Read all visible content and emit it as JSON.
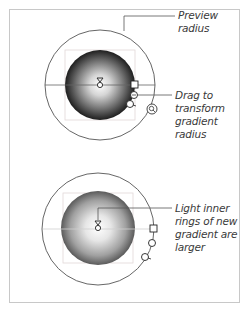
{
  "figure": {
    "panels": [
      {
        "id": "before",
        "callouts": [
          {
            "lines": [
              "Preview",
              "radius"
            ],
            "target": "outer-preview-circle"
          },
          {
            "lines": [
              "Drag to",
              "transform",
              "gradient",
              "radius"
            ],
            "target": "radius-handle"
          }
        ]
      },
      {
        "id": "after",
        "callouts": [
          {
            "lines": [
              "Light inner",
              "rings of new",
              "gradient are",
              "larger"
            ],
            "target": "gradient-center"
          }
        ]
      }
    ],
    "colors": {
      "border": "#c8c8c8",
      "line": "#555555",
      "gradient_inner": "#ffffff",
      "gradient_outer_before": "#1e1e1e",
      "gradient_outer_after": "#5a5a5a",
      "text": "#3a3a3a"
    }
  }
}
